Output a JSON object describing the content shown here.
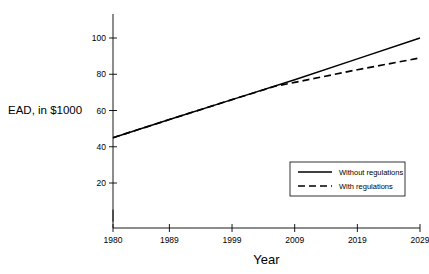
{
  "chart_data": {
    "type": "line",
    "title": "",
    "xlabel": "Year",
    "ylabel": "EAD, in $1000",
    "xlim": [
      1980,
      2029
    ],
    "ylim": [
      0,
      108
    ],
    "grid": false,
    "legend_position": "bottom-right",
    "xticks": [
      1980,
      1989,
      1999,
      2009,
      2019,
      2029
    ],
    "xtick_labels": [
      "1980",
      "1989",
      "1999",
      "2009",
      "2019",
      "2029"
    ],
    "yticks": [
      20,
      40,
      60,
      80,
      100
    ],
    "ytick_labels": [
      "20",
      "40",
      "60",
      "80",
      "100"
    ],
    "y_minor_ticks": [
      2
    ],
    "series": [
      {
        "name": "Without regulations",
        "style": "solid",
        "color": "#000000",
        "x": [
          1980,
          1989,
          1999,
          2009,
          2019,
          2029
        ],
        "values": [
          45,
          55,
          66,
          77,
          88.5,
          100
        ]
      },
      {
        "name": "With regulations",
        "style": "dashed",
        "color": "#000000",
        "x": [
          1980,
          1989,
          1999,
          2006,
          2009,
          2019,
          2029
        ],
        "values": [
          45,
          55,
          66,
          73.5,
          75.5,
          82.5,
          89
        ]
      }
    ]
  },
  "axes": {
    "y_label_text": "EAD, in $1000",
    "x_label_text": "Year"
  },
  "legend": {
    "items": [
      {
        "label": "Without regulations",
        "style": "solid"
      },
      {
        "label": "With regulations",
        "style": "dashed"
      }
    ]
  },
  "colors": {
    "ink": "#000000",
    "background": "#ffffff",
    "axis": "#000000"
  }
}
